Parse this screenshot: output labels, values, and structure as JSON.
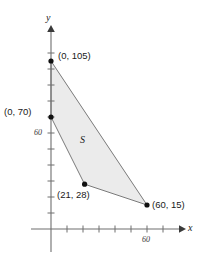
{
  "chart_data": {
    "type": "scatter",
    "title": "",
    "xlabel": "x",
    "ylabel": "y",
    "grid": false,
    "legend": null,
    "xlim": [
      -12,
      82
    ],
    "ylim": [
      -10,
      125
    ],
    "xticks": [
      0,
      10,
      20,
      30,
      40,
      50,
      60,
      70
    ],
    "yticks": [
      10,
      20,
      30,
      40,
      50,
      60,
      70,
      80,
      90,
      100,
      110
    ],
    "xtick_labels": [
      {
        "value": 60,
        "text": "60"
      }
    ],
    "ytick_labels": [
      {
        "value": 60,
        "text": "60"
      }
    ],
    "shaded_region": {
      "name": "S",
      "fill": "#ebebeb",
      "stroke": "#7a7a7a",
      "vertices": [
        {
          "x": 0,
          "y": 105,
          "label": "(0, 105)"
        },
        {
          "x": 60,
          "y": 15,
          "label": "(60, 15)"
        },
        {
          "x": 21,
          "y": 28,
          "label": "(21, 28)"
        },
        {
          "x": 0,
          "y": 70,
          "label": "(0, 70)"
        }
      ]
    },
    "points": [
      {
        "x": 0,
        "y": 105,
        "label": "(0, 105)"
      },
      {
        "x": 0,
        "y": 70,
        "label": "(0, 70)"
      },
      {
        "x": 21,
        "y": 28,
        "label": "(21, 28)"
      },
      {
        "x": 60,
        "y": 15,
        "label": "(60, 15)"
      }
    ]
  },
  "axes": {
    "x_axis_label": "x",
    "y_axis_label": "y",
    "x_tick_label_60": "60",
    "y_tick_label_60": "60",
    "axis_color": "#6e6e6e"
  },
  "annotations": {
    "point_0_105": "(0, 105)",
    "point_0_70": "(0, 70)",
    "point_21_28": "(21, 28)",
    "point_60_15": "(60, 15)",
    "region_label": "S"
  }
}
